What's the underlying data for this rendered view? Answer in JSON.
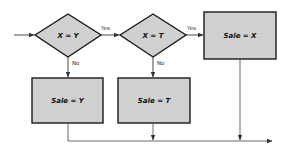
{
  "diagram": {
    "type": "flowchart",
    "colors": {
      "node_fill": "#d0d0d0",
      "stroke": "#1a1a1a",
      "line": "#444444",
      "background": "#ffffff"
    },
    "decisions": [
      {
        "id": "d1",
        "label": "X = Y",
        "yes_label": "Yes",
        "no_label": "No"
      },
      {
        "id": "d2",
        "label": "X = T",
        "yes_label": "Yes",
        "no_label": "No"
      }
    ],
    "processes": [
      {
        "id": "p_x",
        "label": "Sale = X"
      },
      {
        "id": "p_y",
        "label": "Sale = Y"
      },
      {
        "id": "p_t",
        "label": "Sale = T"
      }
    ],
    "edges": [
      {
        "from": "start",
        "to": "d1"
      },
      {
        "from": "d1",
        "to": "d2",
        "label": "Yes"
      },
      {
        "from": "d1",
        "to": "p_y",
        "label": "No"
      },
      {
        "from": "d2",
        "to": "p_x",
        "label": "Yes"
      },
      {
        "from": "d2",
        "to": "p_t",
        "label": "No"
      },
      {
        "from": "p_y",
        "to": "exit"
      },
      {
        "from": "p_t",
        "to": "exit"
      },
      {
        "from": "p_x",
        "to": "exit"
      }
    ]
  }
}
